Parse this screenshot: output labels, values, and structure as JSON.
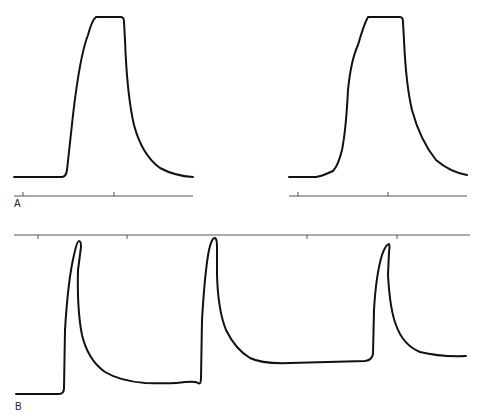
{
  "figure": {
    "panels": [
      {
        "id": "A",
        "label": "A",
        "description": "Two action potential waveforms with flat-topped (clipped) plateau"
      },
      {
        "id": "B",
        "label": "B",
        "description": "Train of three action potentials with time marker line above"
      }
    ],
    "colors": {
      "trace": "#111111",
      "axis": "#555555",
      "background": "#ffffff"
    }
  },
  "labels": {
    "panel_a": "A",
    "panel_b": "B"
  }
}
